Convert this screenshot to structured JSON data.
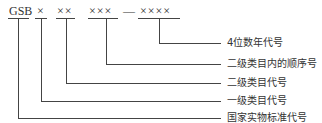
{
  "diagram": {
    "code_parts": [
      {
        "text": "GSB"
      },
      {
        "text": "×"
      },
      {
        "text": "××"
      },
      {
        "text": "×××"
      },
      {
        "text": "—"
      },
      {
        "text": "××××"
      }
    ],
    "labels": [
      "4位数年代号",
      "二级类目内的顺序号",
      "二级类目代号",
      "一级类目代号",
      "国家实物标准代号"
    ]
  }
}
